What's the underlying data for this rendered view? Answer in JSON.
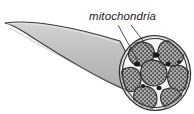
{
  "figure": {
    "name": "muscle-fiber-cross-section",
    "background_color": "#ffffff",
    "width": 194,
    "height": 114
  },
  "labels": {
    "mitochondria": "mitochondria"
  },
  "callout": {
    "label_x": 89,
    "label_y": 20,
    "leader_lines": [
      {
        "x1": 118,
        "y1": 24,
        "x2": 139,
        "y2": 62
      },
      {
        "x1": 130,
        "y1": 24,
        "x2": 152,
        "y2": 55
      }
    ]
  },
  "colors": {
    "body_fill": "#b9b9b9",
    "body_fill_light": "#cfcfcf",
    "body_outline": "#3a3a3a",
    "disc_fill": "#e8e8e8",
    "fiber_fill": "#a8a8a8",
    "fiber_outline": "#2e2e2e",
    "stipple": "#2b2b2b",
    "mitochondria_dark": "#1c1c1c",
    "label_color": "#1a1a1a",
    "leader_color": "#3a3a3a"
  },
  "geometry": {
    "cone": {
      "apex_x": 5,
      "apex_y": 23,
      "top_edge": "M5,23 C30,20 75,28 118,42",
      "bottom_edge": "M5,26 C40,44 90,72 141,96"
    },
    "disc": {
      "center_x": 155,
      "center_y": 73,
      "radius_x": 35,
      "radius_y": 37,
      "rotation": -12
    },
    "fibers": [
      {
        "name": "fiber-upper-left",
        "cx": 141,
        "cy": 54,
        "rx": 13,
        "ry": 12,
        "rot": -20
      },
      {
        "name": "fiber-upper-right",
        "cx": 171,
        "cy": 52,
        "rx": 13,
        "ry": 12,
        "rot": 12
      },
      {
        "name": "fiber-center",
        "cx": 155,
        "cy": 72,
        "rx": 13,
        "ry": 13,
        "rot": 0
      },
      {
        "name": "fiber-left",
        "cx": 133,
        "cy": 78,
        "rx": 11,
        "ry": 12,
        "rot": -28
      },
      {
        "name": "fiber-right",
        "cx": 178,
        "cy": 76,
        "rx": 12,
        "ry": 13,
        "rot": 18
      },
      {
        "name": "fiber-lower-left",
        "cx": 146,
        "cy": 95,
        "rx": 12,
        "ry": 11,
        "rot": -10
      },
      {
        "name": "fiber-lower-right",
        "cx": 170,
        "cy": 96,
        "rx": 11,
        "ry": 10,
        "rot": 15
      }
    ],
    "mitochondria_spots": [
      {
        "name": "mito-spot-upper",
        "cx": 156,
        "cy": 55,
        "r": 3.0
      },
      {
        "name": "mito-spot-left",
        "cx": 138,
        "cy": 63,
        "r": 2.6
      },
      {
        "name": "mito-spot-mid",
        "cx": 166,
        "cy": 63,
        "r": 2.2
      },
      {
        "name": "mito-spot-lower",
        "cx": 158,
        "cy": 87,
        "r": 2.3
      },
      {
        "name": "mito-spot-outer",
        "cx": 143,
        "cy": 86,
        "r": 2.0
      }
    ]
  }
}
